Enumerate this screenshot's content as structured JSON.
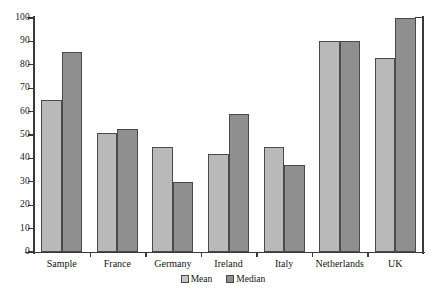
{
  "chart_data": {
    "type": "bar",
    "title": "",
    "subtitle": "",
    "xlabel": "",
    "ylabel": "",
    "categories": [
      "Sample",
      "France",
      "Germany",
      "Ireland",
      "Italy",
      "Netherlands",
      "UK"
    ],
    "series": [
      {
        "name": "Mean",
        "values": [
          65,
          51,
          45,
          42,
          45,
          90,
          83
        ],
        "color": "#b9b9b9"
      },
      {
        "name": "Median",
        "values": [
          85.5,
          52.5,
          30,
          59,
          37,
          90,
          100
        ],
        "color": "#8f8f8f"
      }
    ],
    "ylim": [
      0,
      100
    ],
    "ytick_labels": [
      "0",
      "10",
      "20",
      "30",
      "40",
      "50",
      "60",
      "70",
      "80",
      "90",
      "100"
    ],
    "ytick_values": [
      0,
      10,
      20,
      30,
      40,
      50,
      60,
      70,
      80,
      90,
      100
    ],
    "grid": false,
    "legend_position": "bottom-center",
    "legend_entries": [
      "Mean",
      "Median"
    ]
  }
}
